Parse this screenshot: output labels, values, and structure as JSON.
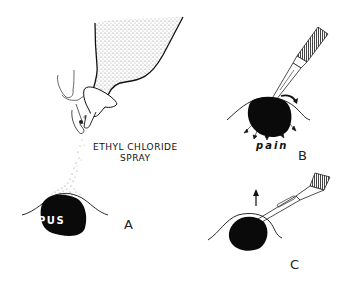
{
  "figure": {
    "panels": [
      {
        "id": "A",
        "letter": "A",
        "labels": {
          "spray_line1": "ETHYL CHLORIDE",
          "spray_line2": "SPRAY",
          "abscess": "PUS"
        }
      },
      {
        "id": "B",
        "letter": "B",
        "labels": {
          "pain": "pain"
        }
      },
      {
        "id": "C",
        "letter": "C"
      }
    ],
    "colors": {
      "ink": "#111111",
      "stipple": "#9a9a9a",
      "background": "#ffffff"
    }
  }
}
